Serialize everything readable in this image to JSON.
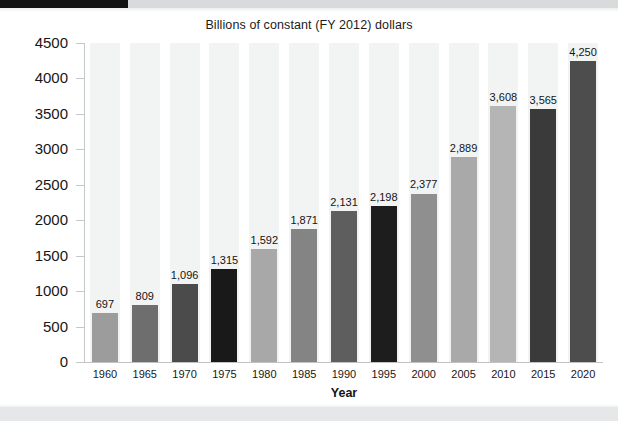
{
  "page": {
    "background_color": "#ffffff",
    "top_banner_color": "#121212",
    "top_strip_color": "#d9dadb",
    "bottom_strip_color": "#e6e7e8"
  },
  "chart_data": {
    "type": "bar",
    "title": "Billions of constant (FY 2012) dollars",
    "xlabel": "Year",
    "ylabel": "",
    "categories": [
      "1960",
      "1965",
      "1970",
      "1975",
      "1980",
      "1985",
      "1990",
      "1995",
      "2000",
      "2005",
      "2010",
      "2015",
      "2020"
    ],
    "values": [
      697,
      809,
      1096,
      1315,
      1592,
      1871,
      2131,
      2198,
      2377,
      2889,
      3608,
      3565,
      4250
    ],
    "value_labels": [
      "697",
      "809",
      "1,096",
      "1,315",
      "1,592",
      "1,871",
      "2,131",
      "2,198",
      "2,377",
      "2,889",
      "3,608",
      "3,565",
      "4,250"
    ],
    "bar_colors": [
      "#9c9c9c",
      "#6e6e6e",
      "#4b4b4b",
      "#191919",
      "#a8a8a8",
      "#848484",
      "#5e5e5e",
      "#1d1d1d",
      "#8f8f8f",
      "#a9a9a9",
      "#b5b5b5",
      "#3a3a3a",
      "#4d4d4d"
    ],
    "ylim": [
      0,
      4500
    ],
    "ytick_labels": [
      "4500",
      "4000",
      "3500",
      "3000",
      "2500",
      "2000",
      "1500",
      "1000",
      "500",
      "0"
    ],
    "ytick_values": [
      4500,
      4000,
      3500,
      3000,
      2500,
      2000,
      1500,
      1000,
      500,
      0
    ],
    "grid": false,
    "legend": "none",
    "band_color": "#f2f3f3",
    "axis_color": "#c6c7c8"
  }
}
